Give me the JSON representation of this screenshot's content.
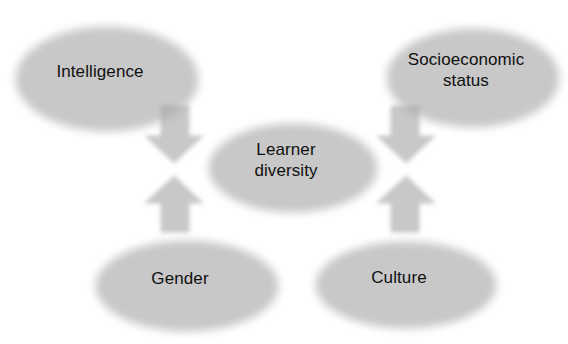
{
  "diagram": {
    "type": "hub-and-spoke concept map",
    "background_color": "#ffffff",
    "palette": {
      "ellipse_fill_light": "#d8d8d8",
      "ellipse_fill_mid": "#c6c6c6",
      "ellipse_fill_dark": "#b4b4b4",
      "ellipse_edge": "#a9a9a9",
      "arrow_fill_light": "#b8b8b8",
      "arrow_fill_dark": "#8f8f8f",
      "arrow_edge": "#7d7d7d",
      "shadow_color": "#bdbdbd",
      "text_color": "#101010"
    },
    "center": {
      "id": "learner-diversity",
      "label": "Learner\ndiversity",
      "cx": 286,
      "cy": 160,
      "rx": 84,
      "ry": 44,
      "font_size": 17
    },
    "nodes": [
      {
        "id": "intelligence",
        "label": "Intelligence",
        "cx": 100,
        "cy": 71,
        "rx": 91,
        "ry": 52,
        "font_size": 17,
        "position": "top-left"
      },
      {
        "id": "socioeconomic-status",
        "label": "Socioeconomic\nstatus",
        "cx": 466,
        "cy": 70,
        "rx": 86,
        "ry": 49,
        "font_size": 17,
        "position": "top-right"
      },
      {
        "id": "gender",
        "label": "Gender",
        "cx": 180,
        "cy": 278,
        "rx": 91,
        "ry": 45,
        "font_size": 17,
        "position": "bottom-left"
      },
      {
        "id": "culture",
        "label": "Culture",
        "cx": 399,
        "cy": 277,
        "rx": 90,
        "ry": 43,
        "font_size": 17,
        "position": "bottom-right"
      }
    ],
    "arrows": [
      {
        "id": "arrow-intelligence-to-center",
        "from": "intelligence",
        "to": "learner-diversity",
        "direction": "down-right",
        "points": "157,101 185,101 185,131 199,131 170,158 141,131 157,131"
      },
      {
        "id": "arrow-socioeconomic-to-center",
        "from": "socioeconomic-status",
        "to": "learner-diversity",
        "direction": "down-left",
        "points": "415,101 387,101 387,131 373,131 402,158 431,131 415,131"
      },
      {
        "id": "arrow-gender-to-center",
        "from": "gender",
        "to": "learner-diversity",
        "direction": "up-right",
        "points": "157,227 185,227 185,198 199,198 170,171 141,198 157,198"
      },
      {
        "id": "arrow-culture-to-center",
        "from": "culture",
        "to": "learner-diversity",
        "direction": "up-left",
        "points": "415,227 387,227 387,198 373,198 402,171 431,198 415,198"
      }
    ]
  }
}
